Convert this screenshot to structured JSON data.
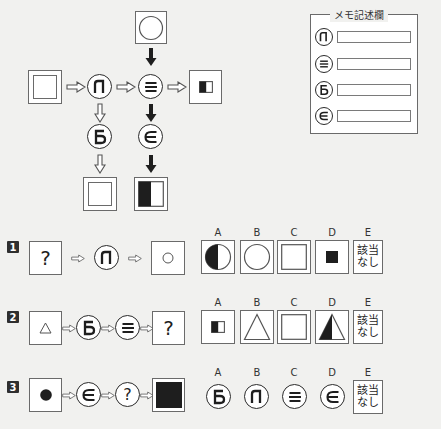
{
  "memo": {
    "title": "メモ記述欄",
    "rows": [
      {
        "symbol": "Л",
        "symbol_name": "el-symbol",
        "value": ""
      },
      {
        "symbol": "≡",
        "symbol_name": "triple-bar-symbol",
        "value": ""
      },
      {
        "symbol": "Б",
        "symbol_name": "be-symbol",
        "value": ""
      },
      {
        "symbol": "∈",
        "symbol_name": "element-of-symbol",
        "value": ""
      }
    ]
  },
  "diagram": {
    "top_input": "circle-in-square",
    "left_input": "double-square",
    "right_output": "small-half-filled-square",
    "bottom_left_output": "double-square",
    "bottom_right_output": "large-half-filled-square",
    "operators": {
      "el": "Л",
      "triple_bar": "≡",
      "be": "Б",
      "element_of": "∈"
    }
  },
  "options_header": [
    "A",
    "B",
    "C",
    "D",
    "E"
  ],
  "not_applicable": {
    "line1": "該当",
    "line2": "なし"
  },
  "questions": [
    {
      "number": "1",
      "sequence": [
        "?",
        "Л",
        "small-circle"
      ],
      "question_mark": "?",
      "symbol_l": "Л",
      "options": [
        {
          "label": "A",
          "content": "half-filled-circle"
        },
        {
          "label": "B",
          "content": "circle"
        },
        {
          "label": "C",
          "content": "double-square"
        },
        {
          "label": "D",
          "content": "small-filled-square"
        },
        {
          "label": "E",
          "content": "該当なし"
        }
      ]
    },
    {
      "number": "2",
      "sequence": [
        "triangle",
        "Б",
        "≡",
        "?"
      ],
      "question_mark": "?",
      "symbol_b": "Б",
      "options": [
        {
          "label": "A",
          "content": "small-half-filled-square"
        },
        {
          "label": "B",
          "content": "triangle"
        },
        {
          "label": "C",
          "content": "double-square"
        },
        {
          "label": "D",
          "content": "half-filled-triangle"
        },
        {
          "label": "E",
          "content": "該当なし"
        }
      ]
    },
    {
      "number": "3",
      "sequence": [
        "filled-circle",
        "∈",
        "?",
        "filled-square"
      ],
      "question_mark": "?",
      "options": [
        {
          "label": "A",
          "content": "Б"
        },
        {
          "label": "B",
          "content": "Л"
        },
        {
          "label": "C",
          "content": "≡"
        },
        {
          "label": "D",
          "content": "∈"
        },
        {
          "label": "E",
          "content": "該当なし"
        }
      ]
    }
  ]
}
